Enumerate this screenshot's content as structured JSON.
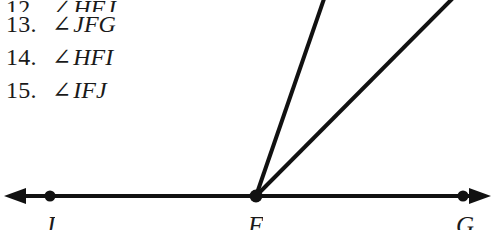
{
  "page": {
    "background_color": "#ffffff",
    "ink_color": "#1a1a1a",
    "width": 494,
    "height": 231
  },
  "exercise_list": {
    "items": [
      {
        "number": "12.",
        "angle_symbol": "∠",
        "expression": "HFJ",
        "clipped": true
      },
      {
        "number": "13.",
        "angle_symbol": "∠",
        "expression": "JFG",
        "clipped": false
      },
      {
        "number": "14.",
        "angle_symbol": "∠",
        "expression": "HFI",
        "clipped": false
      },
      {
        "number": "15.",
        "angle_symbol": "∠",
        "expression": "IFJ",
        "clipped": false
      }
    ]
  },
  "diagram": {
    "line_color": "#111111",
    "labels": {
      "left": "J",
      "vertex": "F",
      "right": "G"
    },
    "geometry": {
      "baseline_y": 196,
      "left_arrow_tip_x": 4,
      "right_arrow_tip_x": 491,
      "point_J_x": 50,
      "vertex_F_x": 256,
      "point_G_x": 463,
      "ray_H_top_x": 322,
      "ray_I_top_x": 452
    }
  }
}
